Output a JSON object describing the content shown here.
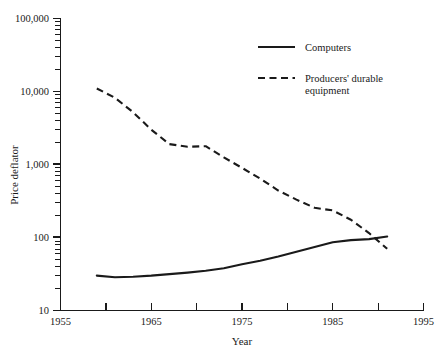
{
  "chart_data": {
    "type": "line",
    "title": "",
    "xlabel": "Year",
    "ylabel": "Price deflator",
    "yscale": "log",
    "xlim": [
      1955,
      1995
    ],
    "ylim": [
      10,
      100000
    ],
    "grid": false,
    "legend_position": "top-right",
    "x_ticks_major": [
      1955,
      1965,
      1975,
      1985,
      1995
    ],
    "x_ticks_minor": [
      1960,
      1970,
      1980,
      1990
    ],
    "x_tick_labels": [
      "1955",
      "1965",
      "1975",
      "1985",
      "1995"
    ],
    "y_ticks_major": [
      10,
      100,
      1000,
      10000,
      100000
    ],
    "y_tick_labels": [
      "10",
      "100",
      "1,000",
      "10,000",
      "100,000"
    ],
    "series": [
      {
        "name": "Computers",
        "style": "solid",
        "color": "#1a1a1a",
        "x": [
          1959,
          1961,
          1963,
          1965,
          1967,
          1969,
          1971,
          1973,
          1975,
          1977,
          1979,
          1981,
          1983,
          1985,
          1987,
          1989,
          1991
        ],
        "values": [
          30,
          28.5,
          29,
          30,
          31.5,
          33,
          35,
          38,
          43,
          48,
          55,
          64,
          74,
          86,
          92,
          95,
          103
        ]
      },
      {
        "name": "Producers' durable equipment",
        "style": "dashed",
        "color": "#1a1a1a",
        "x": [
          1959,
          1961,
          1963,
          1965,
          1967,
          1969,
          1971,
          1973,
          1975,
          1977,
          1979,
          1981,
          1983,
          1985,
          1987,
          1989,
          1991
        ],
        "values": [
          11000,
          8200,
          5200,
          3000,
          1900,
          1750,
          1780,
          1250,
          900,
          640,
          440,
          330,
          255,
          235,
          175,
          115,
          70
        ]
      }
    ]
  },
  "legend": {
    "entries": [
      {
        "label": "Computers",
        "style": "solid"
      },
      {
        "label": "Producers' durable",
        "label2": "equipment",
        "style": "dashed"
      }
    ]
  },
  "axes": {
    "y_title": "Price deflator",
    "x_title": "Year",
    "y_labels": {
      "l100000": "100,000",
      "l10000": "10,000",
      "l1000": "1,000",
      "l100": "100",
      "l10": "10"
    },
    "x_labels": {
      "x1955": "1955",
      "x1965": "1965",
      "x1975": "1975",
      "x1985": "1985",
      "x1995": "1995"
    }
  }
}
